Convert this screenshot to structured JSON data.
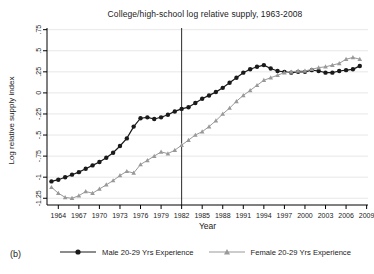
{
  "figure": {
    "panel_label": "(b)",
    "title": "College/high-school log relative supply, 1963-2008",
    "xlabel": "Year",
    "ylabel": "Log relative supply index"
  },
  "colors": {
    "male_series": "#1a1a1a",
    "female_series": "#999999",
    "grid": "#e7e7e7",
    "axis": "#000000",
    "tick_text": "#1a1a1a",
    "vline": "#2a2a2a",
    "background": "#ffffff"
  },
  "legend": {
    "items": [
      {
        "label": "Male 20-29 Yrs Experience",
        "marker": "circle",
        "color_key": "male_series"
      },
      {
        "label": "Female 20-29 Yrs Experience",
        "marker": "triangle",
        "color_key": "female_series"
      }
    ]
  },
  "chart_data": {
    "type": "line",
    "title": "College/high-school log relative supply, 1963-2008",
    "xlabel": "Year",
    "ylabel": "Log relative supply index",
    "grid": true,
    "xlim": [
      1962.35,
      2009.2
    ],
    "ylim": [
      -1.33,
      0.77
    ],
    "x_ticks": [
      1964,
      1967,
      1970,
      1973,
      1976,
      1979,
      1982,
      1985,
      1988,
      1991,
      1994,
      1997,
      2000,
      2003,
      2006,
      2009
    ],
    "x_tick_labels": [
      "1964",
      "1967",
      "1970",
      "1973",
      "1976",
      "1979",
      "1982",
      "1985",
      "1988",
      "1991",
      "1994",
      "1997",
      "2000",
      "2003",
      "2006",
      "2009"
    ],
    "y_ticks": [
      0.75,
      0.5,
      0.25,
      0,
      -0.25,
      -0.5,
      -0.75,
      -1,
      -1.25
    ],
    "y_tick_labels": [
      ".75",
      ".5",
      ".25",
      "0",
      "-.25",
      "-.5",
      "-.75",
      "-1",
      "-1.25"
    ],
    "vline_x": 1982,
    "x": [
      1963,
      1964,
      1965,
      1966,
      1967,
      1968,
      1969,
      1970,
      1971,
      1972,
      1973,
      1974,
      1975,
      1976,
      1977,
      1978,
      1979,
      1980,
      1981,
      1982,
      1983,
      1984,
      1985,
      1986,
      1987,
      1988,
      1989,
      1990,
      1991,
      1992,
      1993,
      1994,
      1995,
      1996,
      1997,
      1998,
      1999,
      2000,
      2001,
      2002,
      2003,
      2004,
      2005,
      2006,
      2007,
      2008
    ],
    "series": [
      {
        "name": "Male 20-29 Yrs Experience",
        "marker": "circle",
        "color_key": "male_series",
        "values": [
          -1.05,
          -1.03,
          -1.0,
          -0.97,
          -0.94,
          -0.9,
          -0.86,
          -0.82,
          -0.77,
          -0.71,
          -0.63,
          -0.54,
          -0.4,
          -0.3,
          -0.29,
          -0.31,
          -0.29,
          -0.26,
          -0.22,
          -0.19,
          -0.17,
          -0.12,
          -0.07,
          -0.03,
          0.01,
          0.06,
          0.12,
          0.18,
          0.24,
          0.28,
          0.31,
          0.33,
          0.29,
          0.26,
          0.25,
          0.24,
          0.25,
          0.25,
          0.27,
          0.26,
          0.24,
          0.24,
          0.26,
          0.27,
          0.28,
          0.32
        ]
      },
      {
        "name": "Female 20-29 Yrs Experience",
        "marker": "triangle",
        "color_key": "female_series",
        "values": [
          -1.12,
          -1.19,
          -1.24,
          -1.25,
          -1.22,
          -1.17,
          -1.19,
          -1.14,
          -1.09,
          -1.04,
          -0.98,
          -0.93,
          -0.95,
          -0.85,
          -0.8,
          -0.75,
          -0.7,
          -0.72,
          -0.68,
          -0.62,
          -0.56,
          -0.5,
          -0.46,
          -0.4,
          -0.33,
          -0.25,
          -0.18,
          -0.1,
          -0.03,
          0.03,
          0.09,
          0.15,
          0.18,
          0.21,
          0.24,
          0.25,
          0.26,
          0.26,
          0.28,
          0.3,
          0.31,
          0.33,
          0.35,
          0.4,
          0.42,
          0.4
        ]
      }
    ]
  }
}
